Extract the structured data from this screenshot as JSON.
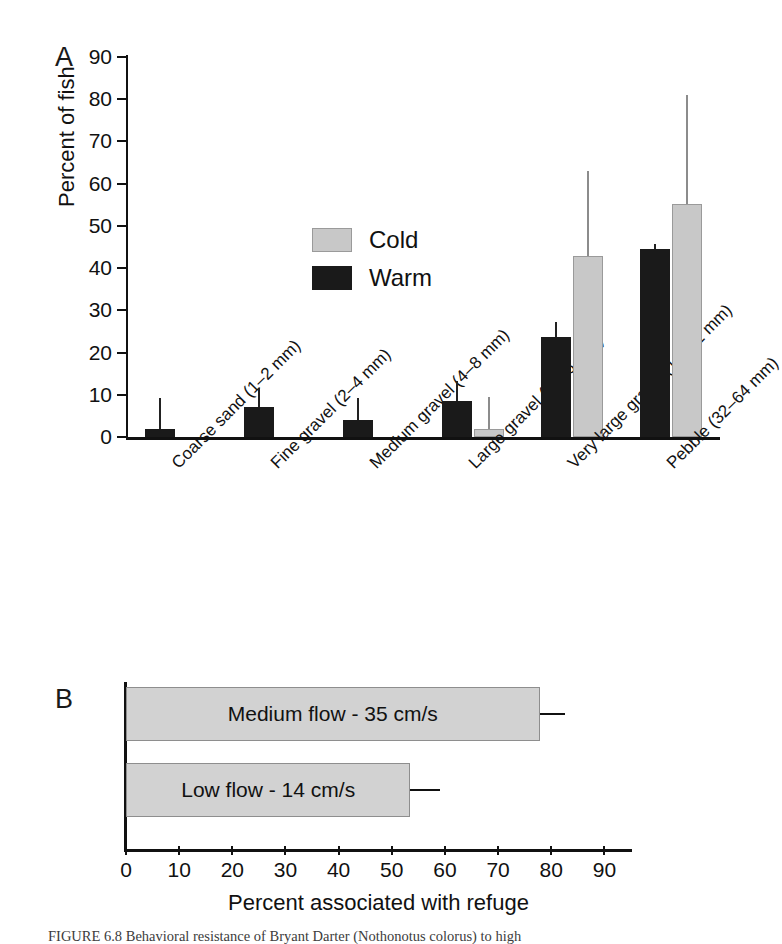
{
  "figure": {
    "panelA_letter": "A",
    "panelB_letter": "B",
    "caption": "FIGURE 6.8  Behavioral resistance of Bryant Darter (Nothonotus colorus) to high"
  },
  "chart_data": [
    {
      "type": "bar",
      "panel": "A",
      "title": "",
      "xlabel": "",
      "ylabel": "Percent of fish",
      "ylim": [
        0,
        90
      ],
      "yticks": [
        0,
        10,
        20,
        30,
        40,
        50,
        60,
        70,
        80,
        90
      ],
      "grid": false,
      "legend_position": "inside-upper-left",
      "categories": [
        "Coarse sand (1–2 mm)",
        "Fine gravel (2–4 mm)",
        "Medium gravel (4–8 mm)",
        "Large gravel (8–16 mm)",
        "Very large gravel (16–32 mm)",
        "Pebble (32–64 mm)"
      ],
      "series": [
        {
          "name": "Cold",
          "color": "#c8c8c8",
          "values": [
            0,
            0,
            0,
            2.0,
            42.8,
            55.2
          ],
          "errors_upper": [
            0,
            0,
            0,
            9.5,
            63.0,
            81.0
          ]
        },
        {
          "name": "Warm",
          "color": "#1a1a1a",
          "values": [
            1.9,
            7.2,
            4.1,
            8.5,
            23.7,
            44.6
          ],
          "errors_upper": [
            9.3,
            11.5,
            9.2,
            13.2,
            27.2,
            45.8
          ]
        }
      ]
    },
    {
      "type": "bar",
      "panel": "B",
      "orientation": "horizontal",
      "title": "",
      "xlabel": "Percent associated with refuge",
      "ylabel": "",
      "xlim": [
        0,
        95
      ],
      "xticks": [
        0,
        10,
        20,
        30,
        40,
        50,
        60,
        70,
        80,
        90
      ],
      "grid": false,
      "bar_color": "#d2d2d2",
      "categories": [
        "Medium flow - 35 cm/s",
        "Low flow - 14 cm/s"
      ],
      "values": [
        77.8,
        53.5
      ],
      "errors_upper": [
        82.5,
        59.0
      ]
    }
  ],
  "legend": {
    "cold_label": "Cold",
    "warm_label": "Warm"
  },
  "axisA": {
    "ylabel": "Percent of fish",
    "ytick_labels": [
      "90",
      "80",
      "70",
      "60",
      "50",
      "40",
      "30",
      "20",
      "10",
      "0"
    ]
  },
  "axisB": {
    "xlabel": "Percent associated with refuge",
    "xtick_labels": [
      "0",
      "10",
      "20",
      "30",
      "40",
      "50",
      "60",
      "70",
      "80",
      "90"
    ]
  }
}
